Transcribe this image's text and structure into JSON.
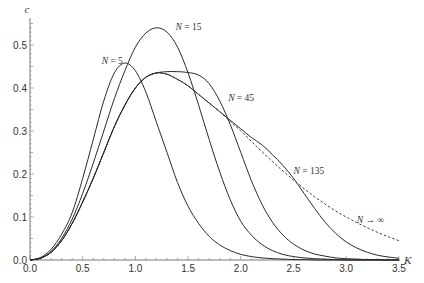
{
  "chart_data": {
    "type": "line",
    "title": "",
    "xlabel": "K",
    "ylabel": "c",
    "xlim": [
      0.0,
      3.5
    ],
    "ylim": [
      0.0,
      0.55
    ],
    "grid": false,
    "legend": "inline labels on curves",
    "x_ticks": [
      "0.0",
      "0.5",
      "1.0",
      "1.5",
      "2.0",
      "2.5",
      "3.0",
      "3.5"
    ],
    "y_ticks": [
      "0.0",
      "0.1",
      "0.2",
      "0.3",
      "0.4",
      "0.5"
    ],
    "x": [
      0.0,
      0.1,
      0.2,
      0.3,
      0.4,
      0.5,
      0.6,
      0.7,
      0.8,
      0.9,
      1.0,
      1.1,
      1.2,
      1.3,
      1.4,
      1.5,
      1.6,
      1.7,
      1.8,
      1.9,
      2.0,
      2.1,
      2.2,
      2.3,
      2.4,
      2.5,
      2.6,
      2.7,
      2.8,
      2.9,
      3.0,
      3.1,
      3.2,
      3.3,
      3.4,
      3.5
    ],
    "series": [
      {
        "name": "N = 5",
        "style": "solid",
        "values": [
          0.0,
          0.006,
          0.025,
          0.06,
          0.11,
          0.19,
          0.28,
          0.37,
          0.435,
          0.458,
          0.44,
          0.39,
          0.32,
          0.25,
          0.18,
          0.125,
          0.085,
          0.055,
          0.035,
          0.022,
          0.013,
          0.008,
          0.005,
          0.003,
          0.002,
          0.001,
          0.001,
          0.0,
          0.0,
          0.0,
          0.0,
          0.0,
          0.0,
          0.0,
          0.0,
          0.0
        ]
      },
      {
        "name": "N = 15",
        "style": "solid",
        "values": [
          0.0,
          0.004,
          0.02,
          0.05,
          0.095,
          0.155,
          0.225,
          0.3,
          0.375,
          0.44,
          0.495,
          0.528,
          0.54,
          0.53,
          0.495,
          0.435,
          0.36,
          0.28,
          0.205,
          0.14,
          0.09,
          0.058,
          0.036,
          0.022,
          0.013,
          0.008,
          0.005,
          0.003,
          0.002,
          0.001,
          0.0,
          0.0,
          0.0,
          0.0,
          0.0,
          0.0
        ]
      },
      {
        "name": "N = 45",
        "style": "solid",
        "values": [
          0.0,
          0.004,
          0.018,
          0.045,
          0.085,
          0.135,
          0.19,
          0.25,
          0.31,
          0.36,
          0.4,
          0.425,
          0.435,
          0.438,
          0.438,
          0.436,
          0.43,
          0.41,
          0.37,
          0.315,
          0.25,
          0.185,
          0.13,
          0.088,
          0.058,
          0.037,
          0.023,
          0.014,
          0.009,
          0.005,
          0.003,
          0.002,
          0.001,
          0.001,
          0.0,
          0.0
        ]
      },
      {
        "name": "N = 135",
        "style": "solid",
        "values": [
          0.0,
          0.004,
          0.018,
          0.045,
          0.085,
          0.135,
          0.19,
          0.25,
          0.31,
          0.36,
          0.4,
          0.425,
          0.435,
          0.432,
          0.42,
          0.405,
          0.385,
          0.365,
          0.345,
          0.325,
          0.305,
          0.285,
          0.268,
          0.245,
          0.22,
          0.19,
          0.155,
          0.12,
          0.088,
          0.062,
          0.042,
          0.028,
          0.018,
          0.011,
          0.007,
          0.004
        ]
      },
      {
        "name": "N → ∞",
        "style": "dashed",
        "values": [
          0.0,
          0.004,
          0.018,
          0.045,
          0.085,
          0.135,
          0.19,
          0.25,
          0.31,
          0.36,
          0.4,
          0.425,
          0.435,
          0.432,
          0.42,
          0.405,
          0.385,
          0.365,
          0.345,
          0.322,
          0.3,
          0.276,
          0.252,
          0.229,
          0.207,
          0.186,
          0.166,
          0.147,
          0.13,
          0.114,
          0.1,
          0.087,
          0.075,
          0.064,
          0.054,
          0.045
        ]
      }
    ],
    "annotations": [
      {
        "text": "N = 5",
        "x": 0.68,
        "y": 0.455
      },
      {
        "text": "N = 15",
        "x": 1.38,
        "y": 0.535
      },
      {
        "text": "N = 45",
        "x": 1.88,
        "y": 0.37
      },
      {
        "text": "N = 135",
        "x": 2.5,
        "y": 0.2
      },
      {
        "text": "N → ∞",
        "x": 3.1,
        "y": 0.085
      }
    ]
  }
}
